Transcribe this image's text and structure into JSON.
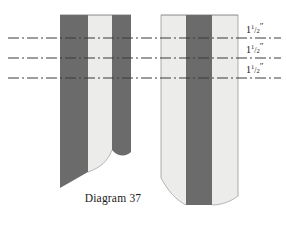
{
  "figure": {
    "caption": "Diagram 37",
    "background_color": "#ffffff"
  },
  "colors": {
    "dark_stripe": "#6b6b6b",
    "light_stripe": "#ececea",
    "light_stripe_edge": "#f4f4f2",
    "outline": "#6f6f6f",
    "center_line": "#3a3a3a",
    "text": "#1a1a1a"
  },
  "panels": [
    {
      "id": "left-panel",
      "name": "left-fabric-panel",
      "stripes": [
        {
          "shade": "dark",
          "color": "#6b6b6b"
        },
        {
          "shade": "light",
          "color": "#ececea"
        },
        {
          "shade": "dark",
          "color": "#6b6b6b"
        }
      ]
    },
    {
      "id": "right-panel",
      "name": "right-fabric-panel",
      "stripes": [
        {
          "shade": "light",
          "color": "#ececea"
        },
        {
          "shade": "dark",
          "color": "#6b6b6b"
        },
        {
          "shade": "light",
          "color": "#ececea"
        }
      ]
    }
  ],
  "dimension_lines": [
    {
      "id": "line-1",
      "y": 38,
      "label_whole": "1",
      "label_num": "1",
      "label_den": "2",
      "label_unit": "″",
      "label_full": "1 1/2\""
    },
    {
      "id": "line-2",
      "y": 58,
      "label_whole": "1",
      "label_num": "1",
      "label_den": "2",
      "label_unit": "″",
      "label_full": "1 1/2\""
    },
    {
      "id": "line-3",
      "y": 78,
      "label_whole": "1",
      "label_num": "1",
      "label_den": "2",
      "label_unit": "″",
      "label_full": "1 1/2\""
    }
  ]
}
